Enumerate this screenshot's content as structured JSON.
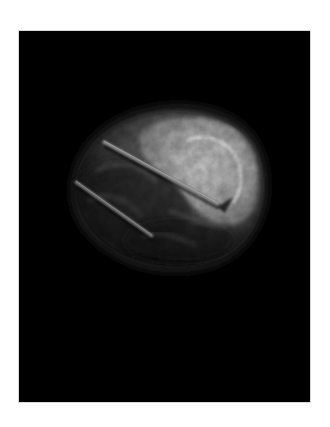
{
  "page": {
    "background": "#ffffff"
  },
  "figure": {
    "frame_color": "#000000",
    "palette": {
      "dark_tissue": "#2a2a2a",
      "mid_tissue": "#6a6a6a",
      "bright_lobe": "#b8b8b8",
      "highlight": "#d6d6d6",
      "needle": "#8a8a8a"
    }
  }
}
